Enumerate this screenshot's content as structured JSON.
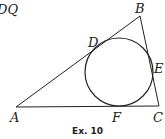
{
  "caption": "Ex. 10",
  "header_fragment": "DQ",
  "points": {
    "A": {
      "label": "A",
      "x": 16,
      "y": 107
    },
    "B": {
      "label": "B",
      "x": 140,
      "y": 16
    },
    "C": {
      "label": "C",
      "x": 159,
      "y": 106
    },
    "D": {
      "label": "D",
      "x": 101,
      "y": 43
    },
    "E": {
      "label": "E",
      "x": 153,
      "y": 70
    },
    "F": {
      "label": "F",
      "x": 119,
      "y": 106
    }
  },
  "incircle": {
    "cx": 119,
    "cy": 72,
    "r": 34
  },
  "colors": {
    "stroke": "#222222"
  }
}
